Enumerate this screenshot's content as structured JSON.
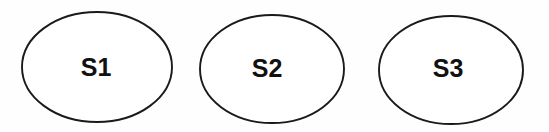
{
  "figure": {
    "background_color": "#fefefe",
    "stroke_color": "#1a1a1a",
    "fill_color": "#ffffff",
    "label_color": "#111111"
  },
  "nodes": [
    {
      "id": "S1",
      "label": "S1",
      "cx": 97,
      "cy": 67,
      "rx": 75,
      "ry": 55,
      "label_x": 96,
      "label_y": 69
    },
    {
      "id": "S2",
      "label": "S2",
      "cx": 272,
      "cy": 69,
      "rx": 72,
      "ry": 54,
      "label_x": 267,
      "label_y": 70
    },
    {
      "id": "S3",
      "label": "S3",
      "cx": 451,
      "cy": 70,
      "rx": 72,
      "ry": 54,
      "label_x": 448,
      "label_y": 70
    }
  ]
}
